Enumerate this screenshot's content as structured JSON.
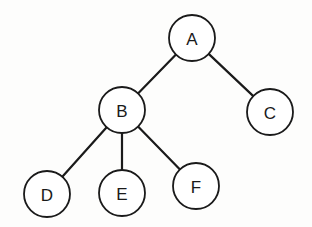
{
  "diagram": {
    "type": "tree",
    "root": "A",
    "node_radius": 23,
    "colors": {
      "stroke": "#1a1a1a",
      "fill": "#ffffff",
      "background": "#fdfdfc"
    },
    "nodes": [
      {
        "id": "A",
        "label": "A",
        "x": 192,
        "y": 38
      },
      {
        "id": "B",
        "label": "B",
        "x": 122,
        "y": 110
      },
      {
        "id": "C",
        "label": "C",
        "x": 270,
        "y": 112
      },
      {
        "id": "D",
        "label": "D",
        "x": 47,
        "y": 194
      },
      {
        "id": "E",
        "label": "E",
        "x": 122,
        "y": 193
      },
      {
        "id": "F",
        "label": "F",
        "x": 196,
        "y": 186
      }
    ],
    "edges": [
      {
        "from": "A",
        "to": "B"
      },
      {
        "from": "A",
        "to": "C"
      },
      {
        "from": "B",
        "to": "D"
      },
      {
        "from": "B",
        "to": "E"
      },
      {
        "from": "B",
        "to": "F"
      }
    ]
  }
}
